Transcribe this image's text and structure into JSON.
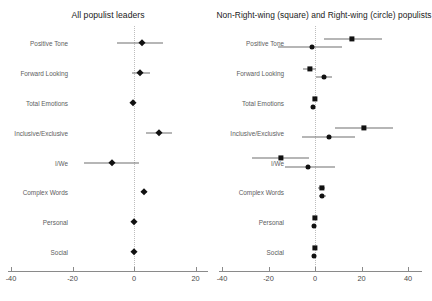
{
  "figure": {
    "background": "#ffffff",
    "marker_color": "#111111",
    "zero_line_color": "#bdbdbd",
    "axis_color": "#8a8a8a"
  },
  "panels": [
    {
      "id": "all-populist-leaders",
      "title": "All populist leaders",
      "xlim": [
        -40,
        20
      ],
      "xticks": [
        -40,
        -20,
        0,
        20
      ],
      "xtick_labels": [
        "-40",
        "-20",
        "0",
        "20"
      ]
    },
    {
      "id": "non-right-wing-and-right-wing-populists",
      "title": "Non-Right-wing (square) and Right-wing (circle) populists",
      "xlim": [
        -40,
        40
      ],
      "xticks": [
        -40,
        -20,
        0,
        20,
        40
      ],
      "xtick_labels": [
        "-40",
        "-20",
        "0",
        "20",
        "40"
      ]
    }
  ],
  "categories": [
    "Positive Tone",
    "Forward Looking",
    "Total Emotions",
    "Inclusive/Exclusive",
    "I/We",
    "Complex Words",
    "Personal",
    "Social"
  ],
  "chart_data": {
    "type": "scatter",
    "title": "",
    "xlabel": "",
    "ylabel": "",
    "grid": false,
    "legend_position": "in-title",
    "reference_line": 0,
    "categories": [
      "Positive Tone",
      "Forward Looking",
      "Total Emotions",
      "Inclusive/Exclusive",
      "I/We",
      "Complex Words",
      "Personal",
      "Social"
    ],
    "panels": [
      {
        "name": "All populist leaders",
        "xlim": [
          -40,
          20
        ],
        "xticks": [
          -40,
          -20,
          0,
          20
        ],
        "series": [
          {
            "name": "All populist leaders",
            "marker": "diamond",
            "points": [
              {
                "category": "Positive Tone",
                "estimate": 2.6,
                "low": -5.5,
                "high": 9.5
              },
              {
                "category": "Forward Looking",
                "estimate": 1.8,
                "low": -0.8,
                "high": 5.2
              },
              {
                "category": "Total Emotions",
                "estimate": -0.4,
                "low": -1.0,
                "high": 0.3
              },
              {
                "category": "Inclusive/Exclusive",
                "estimate": 8.0,
                "low": 3.8,
                "high": 12.4
              },
              {
                "category": "I/We",
                "estimate": -7.2,
                "low": -16.3,
                "high": 1.6
              },
              {
                "category": "Complex Words",
                "estimate": 3.3,
                "low": 2.4,
                "high": 4.2
              },
              {
                "category": "Personal",
                "estimate": 0.0,
                "low": -0.6,
                "high": 0.6
              },
              {
                "category": "Social",
                "estimate": 0.0,
                "low": -0.6,
                "high": 0.6
              }
            ]
          }
        ]
      },
      {
        "name": "Non-Right-wing (square) and Right-wing (circle) populists",
        "xlim": [
          -40,
          40
        ],
        "xticks": [
          -40,
          -20,
          0,
          20,
          40
        ],
        "series": [
          {
            "name": "Non-Right-wing populists",
            "marker": "square",
            "points": [
              {
                "category": "Positive Tone",
                "estimate": 16.0,
                "low": 4.0,
                "high": 28.8
              },
              {
                "category": "Forward Looking",
                "estimate": -2.2,
                "low": -5.2,
                "high": 0.5
              },
              {
                "category": "Total Emotions",
                "estimate": 0.0,
                "low": -0.8,
                "high": 0.8
              },
              {
                "category": "Inclusive/Exclusive",
                "estimate": 21.0,
                "low": 8.5,
                "high": 33.5
              },
              {
                "category": "I/We",
                "estimate": -14.5,
                "low": -27.0,
                "high": -2.5
              },
              {
                "category": "Complex Words",
                "estimate": 3.0,
                "low": 1.5,
                "high": 4.5
              },
              {
                "category": "Personal",
                "estimate": 0.0,
                "low": -0.8,
                "high": 0.8
              },
              {
                "category": "Social",
                "estimate": 0.0,
                "low": -0.8,
                "high": 0.8
              }
            ]
          },
          {
            "name": "Right-wing populists",
            "marker": "circle",
            "points": [
              {
                "category": "Positive Tone",
                "estimate": -1.3,
                "low": -16.0,
                "high": 11.5
              },
              {
                "category": "Forward Looking",
                "estimate": 4.0,
                "low": 0.5,
                "high": 7.5
              },
              {
                "category": "Total Emotions",
                "estimate": -1.0,
                "low": -1.8,
                "high": -0.2
              },
              {
                "category": "Inclusive/Exclusive",
                "estimate": 6.0,
                "low": -5.5,
                "high": 17.0
              },
              {
                "category": "I/We",
                "estimate": -3.0,
                "low": -13.0,
                "high": 8.5
              },
              {
                "category": "Complex Words",
                "estimate": 3.2,
                "low": 1.8,
                "high": 4.6
              },
              {
                "category": "Personal",
                "estimate": -0.5,
                "low": -1.3,
                "high": 0.3
              },
              {
                "category": "Social",
                "estimate": -0.5,
                "low": -1.3,
                "high": 0.3
              }
            ]
          }
        ]
      }
    ]
  }
}
